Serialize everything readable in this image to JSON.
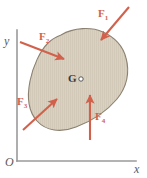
{
  "figure": {
    "type": "free-body-diagram",
    "background_color": "#ffffff",
    "body": {
      "name": "rigid-body-blob",
      "fill_color": "#d9d1c1",
      "stroke_color": "#8b8170",
      "hatch_color": "#c9bfae"
    },
    "axes": {
      "color": "#9a9a9a",
      "origin_label": "O",
      "x_label": "x",
      "y_label": "y",
      "y_axis_top": 30,
      "x_axis_right": 136,
      "corner_x": 17,
      "corner_y": 161
    },
    "centroid": {
      "label": "G",
      "marker": "open-circle",
      "x": 72,
      "y": 79
    },
    "force_color": "#d2614c",
    "forces": [
      {
        "label": "F",
        "sub": "1",
        "tail_x": 129,
        "tail_y": 7,
        "head_x": 99,
        "head_y": 43,
        "label_x": 99,
        "label_y": 9
      },
      {
        "label": "F",
        "sub": "2",
        "tail_x": 20,
        "tail_y": 42,
        "head_x": 67,
        "head_y": 61,
        "label_x": 40,
        "label_y": 32
      },
      {
        "label": "F",
        "sub": "3",
        "tail_x": 23,
        "tail_y": 130,
        "head_x": 60,
        "head_y": 97,
        "label_x": 17,
        "label_y": 97
      },
      {
        "label": "F",
        "sub": "4",
        "tail_x": 90,
        "tail_y": 140,
        "head_x": 90,
        "head_y": 92,
        "label_x": 95,
        "label_y": 112
      }
    ]
  }
}
